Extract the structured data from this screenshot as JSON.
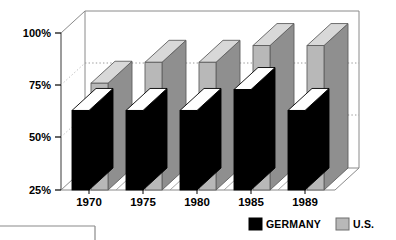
{
  "chart_data": {
    "type": "bar",
    "title": "",
    "subtitle": "",
    "xlabel": "",
    "ylabel": "",
    "categories": [
      "1970",
      "1975",
      "1980",
      "1985",
      "1989"
    ],
    "series": [
      {
        "name": "GERMANY",
        "color": "#000000",
        "values": [
          63,
          63,
          63,
          73,
          63
        ]
      },
      {
        "name": "U.S.",
        "color": "#b8b8b8",
        "values": [
          76,
          86,
          86,
          94,
          94
        ]
      }
    ],
    "ylim": [
      25,
      100
    ],
    "yticks": [
      25,
      50,
      75,
      100
    ],
    "ytick_labels": [
      "25%",
      "50%",
      "75%",
      "100%"
    ],
    "grid": true,
    "grid_style": "dotted-horizontal",
    "legend_position": "bottom-right",
    "style": "3d-isometric-bars"
  },
  "axis": {
    "y_labels": [
      "100%",
      "75%",
      "50%",
      "25%"
    ],
    "x_labels": [
      "1970",
      "1975",
      "1980",
      "1985",
      "1989"
    ]
  },
  "legend": {
    "items": [
      {
        "label": "GERMANY",
        "swatch": "#000000"
      },
      {
        "label": "U.S.",
        "swatch": "#b8b8b8"
      }
    ]
  },
  "colors": {
    "germany": "#000000",
    "us": "#b8b8b8",
    "us_top": "#d8d8d8",
    "us_side": "#8f8f8f",
    "germany_top": "#ffffff",
    "germany_side": "#000000",
    "axis": "#707070",
    "grid": "#9a9a9a",
    "background": "#ffffff",
    "text": "#000000"
  }
}
